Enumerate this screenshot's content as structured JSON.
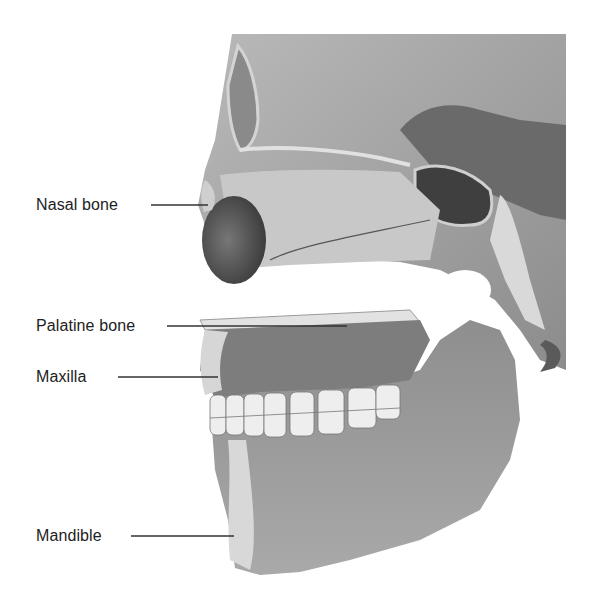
{
  "figure": {
    "labels": [
      {
        "id": "nasal",
        "text": "Nasal bone",
        "x": 36,
        "y": 196,
        "line": [
          151,
          205,
          208,
          205
        ]
      },
      {
        "id": "palatine",
        "text": "Palatine bone",
        "x": 36,
        "y": 317,
        "line": [
          167,
          326,
          347,
          326
        ]
      },
      {
        "id": "maxilla",
        "text": "Maxilla",
        "x": 36,
        "y": 368,
        "line": [
          118,
          377,
          218,
          377
        ]
      },
      {
        "id": "mandible",
        "text": "Mandible",
        "x": 36,
        "y": 527,
        "line": [
          131,
          536,
          234,
          536
        ]
      }
    ],
    "colors": {
      "label_text": "#222222",
      "leader_line": "#333333",
      "bone_light": "#d9d9d9",
      "bone_mid": "#a8a8a8",
      "bone_dark": "#6e6e6e",
      "cavity": "#4a4a4a"
    }
  }
}
